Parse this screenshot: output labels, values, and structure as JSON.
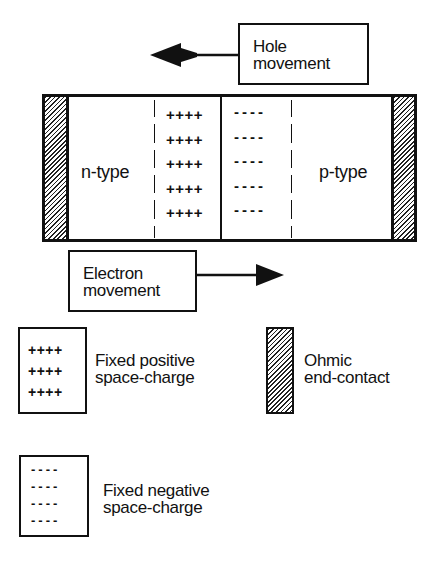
{
  "diagram": {
    "hole_movement": {
      "line1": "Hole",
      "line2": "movement",
      "direction": "left"
    },
    "electron_movement": {
      "line1": "Electron",
      "line2": "movement",
      "direction": "right"
    },
    "junction": {
      "n_region_label": "n-type",
      "p_region_label": "p-type",
      "positive_rows": [
        "++++",
        "++++",
        "++++",
        "++++",
        "++++"
      ],
      "negative_rows": [
        "----",
        "----",
        "----",
        "----",
        "----"
      ]
    },
    "legend": {
      "positive": {
        "symbol_rows": [
          "++++",
          "++++",
          "++++"
        ],
        "line1": "Fixed positive",
        "line2": "space-charge"
      },
      "contact": {
        "line1": "Ohmic",
        "line2": "end-contact"
      },
      "negative": {
        "symbol_rows": [
          "----",
          "----",
          "----",
          "----"
        ],
        "line1": "Fixed negative",
        "line2": "space-charge"
      }
    },
    "colors": {
      "ink": "#111111",
      "background": "#ffffff"
    }
  }
}
